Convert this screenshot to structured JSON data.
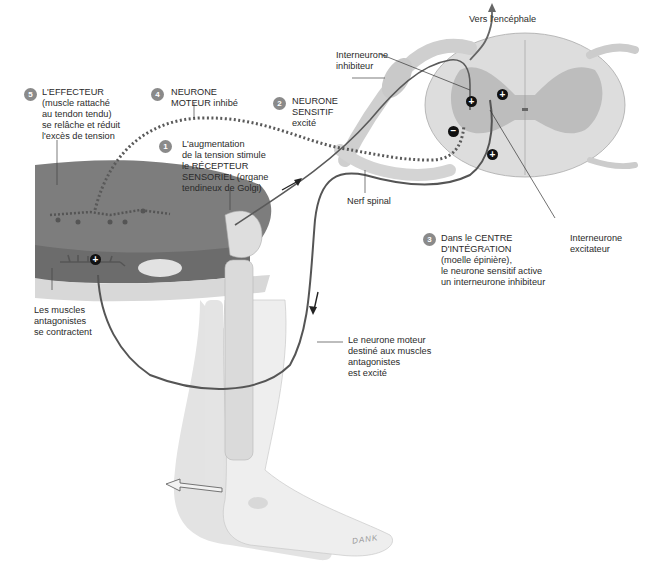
{
  "diagram": {
    "type": "reflexe tendineux (arc réflexe)",
    "labels": {
      "effecteur": {
        "number": "5",
        "text": "L'EFFECTEUR\n(muscle rattaché\nau tendon tendu)\nse relâche et réduit\nl'excès de tension"
      },
      "neurone_moteur": {
        "number": "4",
        "text": "NEURONE\nMOTEUR inhibé"
      },
      "neurone_sensitif": {
        "number": "2",
        "text": "NEURONE\nSENSITIF\nexcité"
      },
      "recepteur": {
        "number": "1",
        "text": "L'augmentation\nde la tension stimule\nle RÉCEPTEUR\nSENSORIEL (organe\ntendineux de Golgi)"
      },
      "centre_integration": {
        "number": "3",
        "text": "Dans le CENTRE\nD'INTÉGRATION\n(moelle épinière),\nle neurone sensitif active\nun interneurone inhibiteur"
      },
      "vers_encephale": "Vers l'encéphale",
      "interneurone_inhibiteur": "Interneurone\ninhibiteur",
      "interneurone_excitateur": "Interneurone\nexcitateur",
      "nerf_spinal": "Nerf spinal",
      "muscles_antagonistes": "Les muscles\nantagonistes\nse contractent",
      "neurone_moteur_antagonistes": "Le neurone moteur\ndestiné aux muscles\nantagonistes\nest excité"
    },
    "symbols": {
      "plus": "+",
      "minus": "−"
    },
    "signature": "DANK",
    "colors": {
      "muscle": "#7d7d7d",
      "muscle_dark": "#5e5e5e",
      "bone": "#dcdcdc",
      "skin": "#e6e6e6",
      "spinal_grey": "#bdbdbd",
      "spinal_white": "#e9e9e9",
      "neuron": "#4a4a4a",
      "badge": "#8a8a8a"
    }
  }
}
